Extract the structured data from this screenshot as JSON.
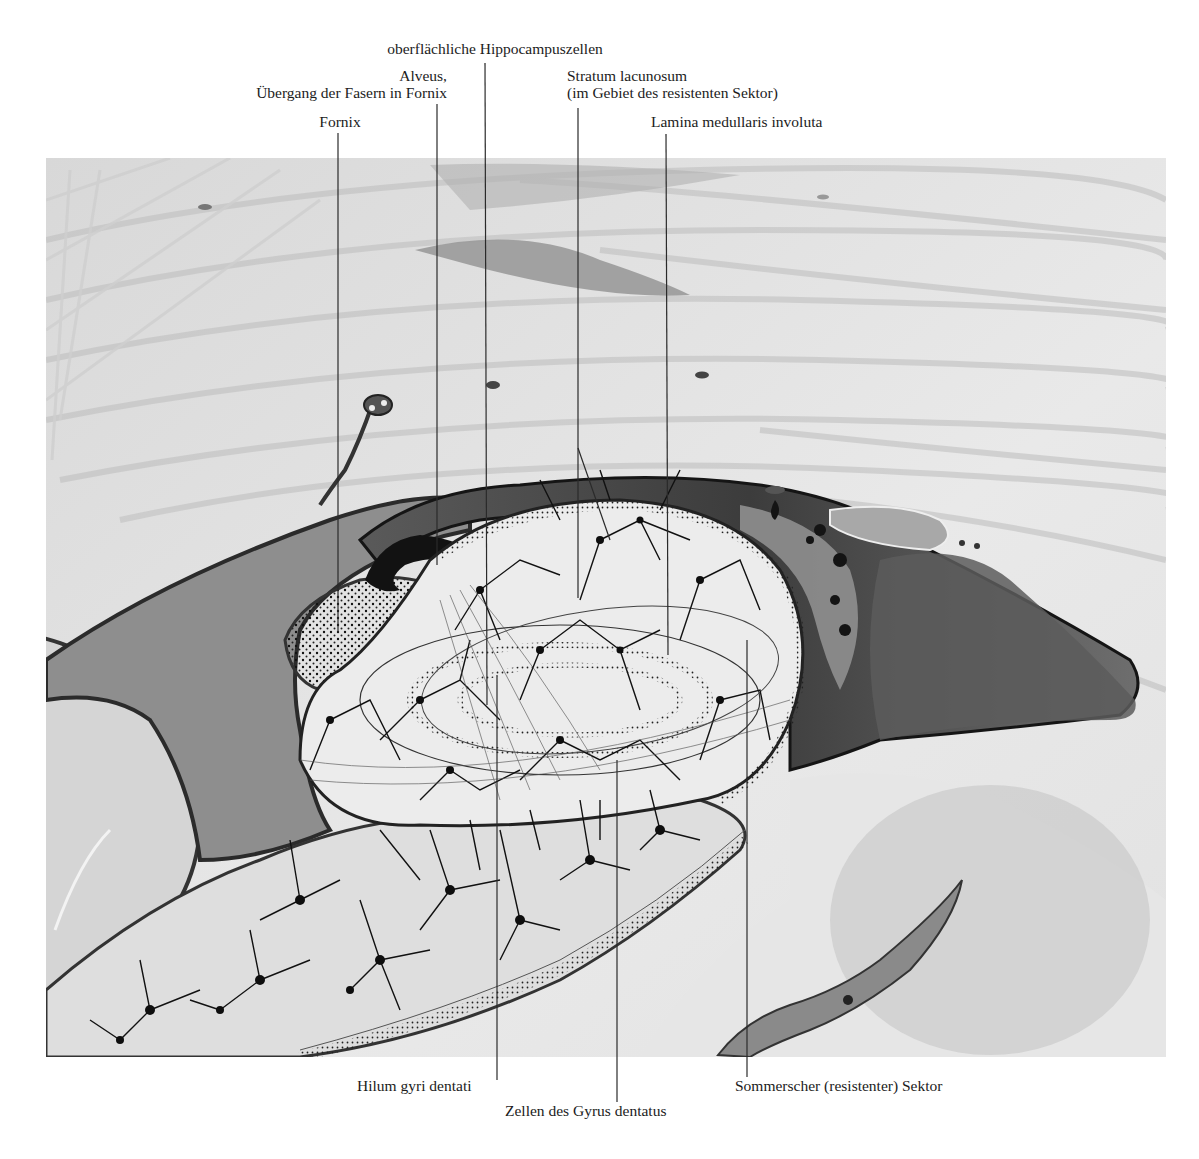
{
  "figure": {
    "colors": {
      "background": "#ffffff",
      "tissue_light": "#e4e4e4",
      "tissue_mid": "#c9c9c9",
      "fiber_streak": "#b8b8b8",
      "ventricle_dark": "#6a6a6a",
      "alveus_black": "#1e1e1e",
      "hippocampus_fill": "#ececec",
      "neuron": "#111111",
      "leader_line": "#2a2a2a"
    }
  },
  "labels": {
    "top": [
      {
        "id": "oberflaechliche",
        "lines": [
          "oberflächliche Hippocampuszellen"
        ]
      },
      {
        "id": "alveus",
        "lines": [
          "Alveus,",
          "Übergang der Fasern in Fornix"
        ]
      },
      {
        "id": "fornix",
        "lines": [
          "Fornix"
        ]
      },
      {
        "id": "stratum",
        "lines": [
          "Stratum lacunosum",
          "(im Gebiet des resistenten Sektor)"
        ]
      },
      {
        "id": "lamina",
        "lines": [
          "Lamina medullaris involuta"
        ]
      }
    ],
    "bottom": [
      {
        "id": "hilum",
        "lines": [
          "Hilum gyri dentati"
        ]
      },
      {
        "id": "zellen",
        "lines": [
          "Zellen des Gyrus dentatus"
        ]
      },
      {
        "id": "sommer",
        "lines": [
          "Sommerscher (resistenter) Sektor"
        ]
      }
    ]
  }
}
